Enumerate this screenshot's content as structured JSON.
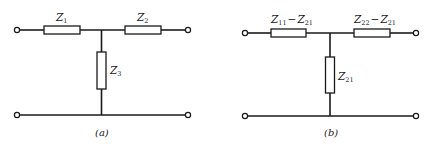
{
  "diagrams": [
    {
      "id": "a",
      "caption": "(a)",
      "series_left": {
        "symbol": "Z",
        "subscript": "1"
      },
      "series_right": {
        "symbol": "Z",
        "subscript": "2"
      },
      "shunt": {
        "symbol": "Z",
        "subscript": "3"
      }
    },
    {
      "id": "b",
      "caption": "(b)",
      "series_left": {
        "symbol": "Z",
        "subscript": "11",
        "minus": "−",
        "symbol2": "Z",
        "subscript2": "21"
      },
      "series_right": {
        "symbol": "Z",
        "subscript": "22",
        "minus": "−",
        "symbol2": "Z",
        "subscript2": "21"
      },
      "shunt": {
        "symbol": "Z",
        "subscript": "21"
      }
    }
  ],
  "colors": {
    "line": "#1a1a1a",
    "background": "#ffffff"
  }
}
